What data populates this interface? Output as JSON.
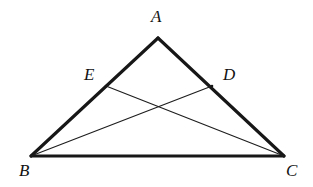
{
  "figure": {
    "width": 313,
    "height": 187,
    "background_color": "#ffffff",
    "stroke_color": "#171717",
    "label_color": "#121212"
  },
  "labels": {
    "apex": "A",
    "bottom_left": "B",
    "bottom_right": "C",
    "on_side_ac": "D",
    "on_side_ab": "E"
  },
  "geometry": {
    "points": {
      "A": {
        "x": 158,
        "y": 38
      },
      "B": {
        "x": 31,
        "y": 156
      },
      "C": {
        "x": 284,
        "y": 156
      },
      "D": {
        "x": 212,
        "y": 86
      },
      "E": {
        "x": 106,
        "y": 86
      },
      "P": {
        "x": 160,
        "y": 106
      }
    },
    "label_positions": {
      "A": {
        "x": 151,
        "y": 8
      },
      "B": {
        "x": 19,
        "y": 162
      },
      "C": {
        "x": 286,
        "y": 162
      },
      "D": {
        "x": 223,
        "y": 66
      },
      "E": {
        "x": 84,
        "y": 66
      }
    },
    "sides": [
      {
        "name": "AB",
        "from": "A",
        "to": "B",
        "weight": "thick"
      },
      {
        "name": "AC",
        "from": "A",
        "to": "C",
        "weight": "thick"
      },
      {
        "name": "BC",
        "from": "B",
        "to": "C",
        "weight": "thick"
      }
    ],
    "cevians": [
      {
        "name": "BD",
        "from": "B",
        "to": "D",
        "weight": "thin"
      },
      {
        "name": "CE",
        "from": "C",
        "to": "E",
        "weight": "thin"
      }
    ]
  }
}
